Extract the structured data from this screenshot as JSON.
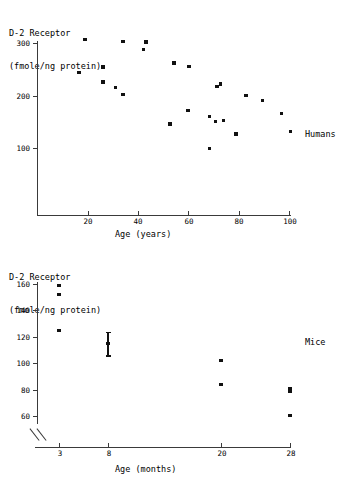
{
  "figure": {
    "panels": [
      {
        "id": "humans",
        "group_label": "Humans",
        "y_axis_title_line1": "D-2 Receptor",
        "y_axis_title_line2": "(fmole/ng protein)",
        "x_axis_title": "Age (years)",
        "y_ticks": [
          "300",
          "200",
          "100"
        ],
        "x_ticks": [
          "20",
          "40",
          "60",
          "80",
          "100"
        ]
      },
      {
        "id": "mice",
        "group_label": "Mice",
        "y_axis_title_line1": "D-2 Receptor",
        "y_axis_title_line2": "(fmole/ng protein)",
        "x_axis_title": "Age (months)",
        "y_ticks": [
          "160",
          "140",
          "120",
          "100",
          "80",
          "60"
        ],
        "x_ticks": [
          "3",
          "8",
          "20",
          "28"
        ]
      }
    ]
  },
  "chart_data": [
    {
      "type": "scatter",
      "id": "humans",
      "title": "Humans",
      "xlabel": "Age (years)",
      "ylabel": "D-2 Receptor (fmole/ng protein)",
      "xlim": [
        0,
        100
      ],
      "ylim": [
        0,
        310
      ],
      "xticks": [
        20,
        40,
        60,
        80,
        100
      ],
      "yticks": [
        100,
        200,
        300
      ],
      "grid": false,
      "legend": "none",
      "annotations": [
        "Humans"
      ],
      "points": [
        {
          "x": 19,
          "y": 307
        },
        {
          "x": 16.5,
          "y": 244
        },
        {
          "x": 26,
          "y": 254
        },
        {
          "x": 26,
          "y": 226
        },
        {
          "x": 31,
          "y": 215
        },
        {
          "x": 34,
          "y": 303
        },
        {
          "x": 34,
          "y": 202
        },
        {
          "x": 42,
          "y": 288
        },
        {
          "x": 43,
          "y": 302
        },
        {
          "x": 52.5,
          "y": 146
        },
        {
          "x": 54,
          "y": 262
        },
        {
          "x": 59.5,
          "y": 171
        },
        {
          "x": 60,
          "y": 255
        },
        {
          "x": 68,
          "y": 99
        },
        {
          "x": 68,
          "y": 160
        },
        {
          "x": 70.5,
          "y": 150
        },
        {
          "x": 71,
          "y": 217
        },
        {
          "x": 72.5,
          "y": 222
        },
        {
          "x": 73.5,
          "y": 152
        },
        {
          "x": 78.5,
          "y": 127
        },
        {
          "x": 82.5,
          "y": 200
        },
        {
          "x": 89,
          "y": 191
        },
        {
          "x": 96.5,
          "y": 166
        },
        {
          "x": 100,
          "y": 132
        }
      ]
    },
    {
      "type": "scatter",
      "id": "mice",
      "title": "Mice",
      "xlabel": "Age (months)",
      "ylabel": "D-2 Receptor (fmole/ng protein)",
      "ylim": [
        50,
        163
      ],
      "yticks": [
        60,
        80,
        100,
        120,
        140,
        160
      ],
      "xticks": [
        3,
        8,
        20,
        28
      ],
      "y_axis_break": true,
      "grid": false,
      "legend": "none",
      "annotations": [
        "Mice"
      ],
      "points": [
        {
          "x": 3,
          "y": 159
        },
        {
          "x": 3,
          "y": 152
        },
        {
          "x": 3,
          "y": 125
        },
        {
          "x": 8,
          "y": 115,
          "yerr": 9
        },
        {
          "x": 20,
          "y": 102
        },
        {
          "x": 20,
          "y": 84
        },
        {
          "x": 28,
          "y": 81
        },
        {
          "x": 28,
          "y": 79
        },
        {
          "x": 28,
          "y": 60.5
        }
      ]
    }
  ]
}
